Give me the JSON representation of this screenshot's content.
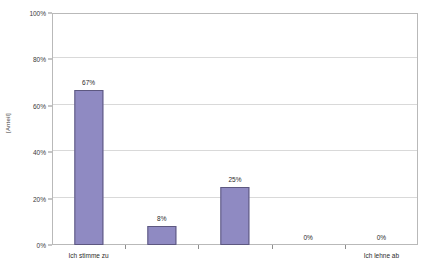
{
  "chart_data": {
    "type": "bar",
    "title": "",
    "xlabel": "",
    "ylabel": "[Anteil]",
    "categories": [
      "Ich stimme zu",
      "",
      "",
      "",
      "Ich lehne ab"
    ],
    "category_labels_shown": [
      "Ich stimme zu",
      "Ich lehne ab"
    ],
    "values": [
      67,
      8,
      25,
      0,
      0
    ],
    "value_labels": [
      "67%",
      "8%",
      "25%",
      "0%",
      "0%"
    ],
    "ylim": [
      0,
      100
    ],
    "y_ticks": [
      0,
      20,
      40,
      60,
      80,
      100
    ],
    "y_tick_labels": [
      "0%",
      "20%",
      "40%",
      "60%",
      "80%",
      "100%"
    ],
    "grid": true,
    "legend": "none",
    "bar_color": "#8f8ac2",
    "bar_border_color": "#5d5880",
    "gridline_color": "#d9d9d9",
    "frame_color": "#b9b9b9",
    "background": "#ffffff"
  }
}
